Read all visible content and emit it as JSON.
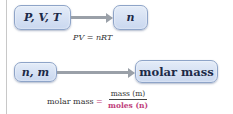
{
  "diagram": {
    "row1": {
      "source_box": "P, V, T",
      "target_box": "n",
      "equation": "PV = nRT"
    },
    "row2": {
      "source_box": "n, m",
      "target_box": "molar mass",
      "formula": {
        "label": "molar mass",
        "equals": "=",
        "numerator": "mass (m)",
        "denominator": "moles (n)"
      }
    },
    "colors": {
      "box_fill": "#d4e0f3",
      "box_border": "#8ea4c8",
      "arrow": "#9aa0a8",
      "moles_accent": "#c0407a"
    }
  }
}
